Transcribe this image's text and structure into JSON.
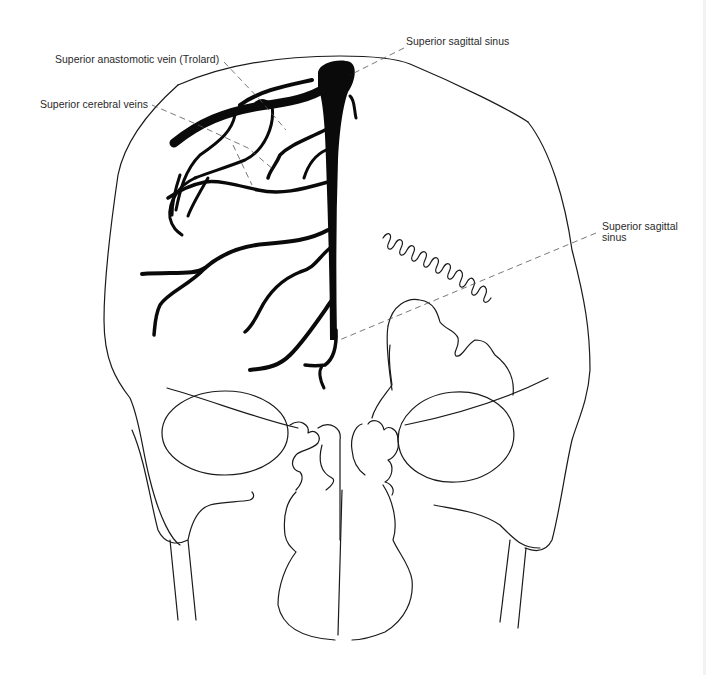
{
  "figure": {
    "labels": {
      "trolard": "Superior anastomotic vein (Trolard)",
      "cerebral_veins": "Superior cerebral veins",
      "sss_top": "Superior sagittal sinus",
      "sss_right_line1": "Superior sagittal",
      "sss_right_line2": "sinus"
    },
    "colors": {
      "background": "#ffffff",
      "veins": "#0a0a0a",
      "outline": "#1a1a1a",
      "leader_lines": "#555555",
      "label_text": "#2a2a2a"
    }
  }
}
